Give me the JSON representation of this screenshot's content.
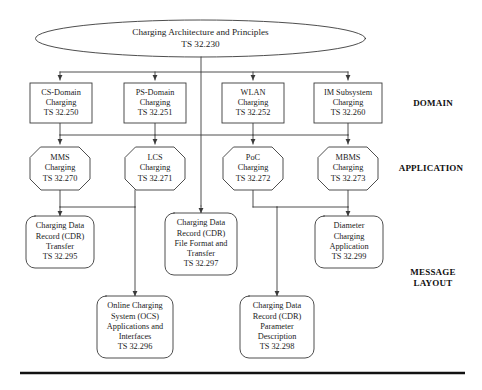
{
  "diagram": {
    "root": {
      "id": "charging-architecture",
      "shape": "ellipse",
      "lines": [
        "Charging Architecture and Principles",
        "TS 32.230"
      ]
    },
    "tiers": [
      {
        "id": "domain",
        "label": "DOMAIN"
      },
      {
        "id": "application",
        "label": "APPLICATION"
      },
      {
        "id": "message-layout",
        "label_lines": [
          "MESSAGE",
          "LAYOUT"
        ]
      }
    ],
    "domain_nodes": [
      {
        "id": "cs-domain-charging",
        "shape": "rect",
        "lines": [
          "CS-Domain",
          "Charging",
          "TS 32.250"
        ]
      },
      {
        "id": "ps-domain-charging",
        "shape": "rect",
        "lines": [
          "PS-Domain",
          "Charging",
          "TS 32.251"
        ]
      },
      {
        "id": "wlan-charging",
        "shape": "rect",
        "lines": [
          "WLAN",
          "Charging",
          "TS 32.252"
        ]
      },
      {
        "id": "im-subsystem-charging",
        "shape": "rect",
        "lines": [
          "IM Subsystem",
          "Charging",
          "TS 32.260"
        ]
      }
    ],
    "application_nodes": [
      {
        "id": "mms-charging",
        "shape": "octagon",
        "lines": [
          "MMS",
          "Charging",
          "TS 32.270"
        ]
      },
      {
        "id": "lcs-charging",
        "shape": "octagon",
        "lines": [
          "LCS",
          "Charging",
          "TS 32.271"
        ]
      },
      {
        "id": "poc-charging",
        "shape": "octagon",
        "lines": [
          "PoC",
          "Charging",
          "TS 32.272"
        ]
      },
      {
        "id": "mbms-charging",
        "shape": "octagon",
        "lines": [
          "MBMS",
          "Charging",
          "TS 32.273"
        ]
      }
    ],
    "message_layout_nodes": [
      {
        "id": "cdr-transfer",
        "shape": "rounded-rect",
        "lines": [
          "Charging Data",
          "Record (CDR)",
          "Transfer",
          "TS 32.295"
        ]
      },
      {
        "id": "cdr-file-format-transfer",
        "shape": "rounded-rect",
        "lines": [
          "Charging Data",
          "Record (CDR)",
          "File Format and",
          "Transfer",
          "TS 32.297"
        ]
      },
      {
        "id": "diameter-charging-application",
        "shape": "rounded-rect",
        "lines": [
          "Diameter",
          "Charging",
          "Application",
          "TS 32.299"
        ]
      },
      {
        "id": "ocs-applications-interfaces",
        "shape": "rounded-rect",
        "lines": [
          "Online Charging",
          "System (OCS)",
          "Applications and",
          "Interfaces",
          "TS 32.296"
        ]
      },
      {
        "id": "cdr-parameter-description",
        "shape": "rounded-rect",
        "lines": [
          "Charging Data",
          "Record (CDR)",
          "Parameter",
          "Description",
          "TS 32.298"
        ]
      }
    ],
    "style": {
      "stroke": "#3a3a3a",
      "text": "#1b1b1b",
      "background": "#ffffff",
      "rule": "#111111"
    }
  }
}
